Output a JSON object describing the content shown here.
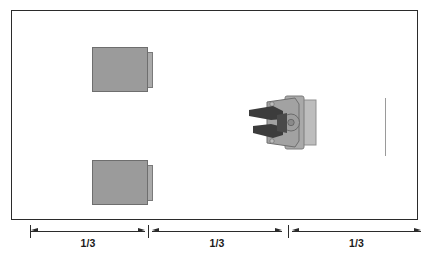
{
  "figure": {
    "frame": {
      "name": "workspace-boundary",
      "stroke": "#2b2b2b",
      "fill": "#ffffff"
    },
    "parts": [
      {
        "name": "upper-part-box",
        "label": "",
        "fill": "#9b9b9b",
        "flange_fill": "#aaaaaa"
      },
      {
        "name": "lower-part-box",
        "label": "",
        "fill": "#9b9b9b",
        "flange_fill": "#aaaaaa"
      }
    ],
    "gripper": {
      "name": "robot-gripper",
      "label": "",
      "body_fill": "#a6a6a6",
      "finger_fill": "#3a3a3a",
      "mount_fill": "#bdbdbd"
    },
    "reference_line": {
      "name": "vertical-reference-line",
      "color": "#9a9a9a"
    },
    "dimensions": {
      "segments": [
        {
          "label": "1/3"
        },
        {
          "label": "1/3"
        },
        {
          "label": "1/3"
        }
      ],
      "line_color": "#2b2b2b"
    }
  }
}
